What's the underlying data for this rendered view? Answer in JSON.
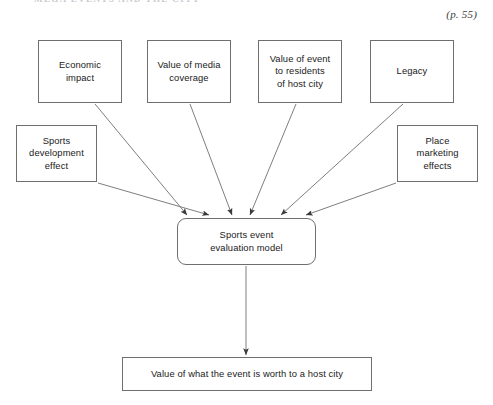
{
  "page": {
    "width": 493,
    "height": 405,
    "background": "#ffffff",
    "page_reference": "(p. 55)",
    "cropped_header_text": "MEGA EVENTS AND THE CITY"
  },
  "diagram": {
    "title": "Sports event evaluation model",
    "type": "convergent-flow-diagram",
    "line_color": "#6f6f6f",
    "text_color": "#1a1a1a",
    "nodes": [
      {
        "id": "economic-impact",
        "label": "Economic\nimpact",
        "role": "input",
        "x": 38,
        "y": 40,
        "w": 84,
        "h": 63,
        "shape": "rectangle"
      },
      {
        "id": "value-of-media-coverage",
        "label": "Value of media\ncoverage",
        "role": "input",
        "x": 147,
        "y": 40,
        "w": 84,
        "h": 63,
        "shape": "rectangle"
      },
      {
        "id": "value-of-event-to-residents",
        "label": "Value of event\nto residents\nof host city",
        "role": "input",
        "x": 258,
        "y": 40,
        "w": 84,
        "h": 63,
        "shape": "rectangle"
      },
      {
        "id": "legacy",
        "label": "Legacy",
        "role": "input",
        "x": 370,
        "y": 40,
        "w": 84,
        "h": 63,
        "shape": "rectangle"
      },
      {
        "id": "sports-development-effect",
        "label": "Sports\ndevelopment\neffect",
        "role": "input",
        "x": 16,
        "y": 125,
        "w": 81,
        "h": 57,
        "shape": "rectangle"
      },
      {
        "id": "place-marketing-effects",
        "label": "Place\nmarketing\neffects",
        "role": "input",
        "x": 397,
        "y": 125,
        "w": 81,
        "h": 57,
        "shape": "rectangle"
      },
      {
        "id": "sports-event-evaluation-model",
        "label": "Sports event\nevaluation model",
        "role": "process",
        "x": 177,
        "y": 218,
        "w": 139,
        "h": 47,
        "shape": "rounded-rectangle"
      },
      {
        "id": "value-to-host-city",
        "label": "Value of what the event is worth to a host city",
        "role": "output",
        "x": 122,
        "y": 357,
        "w": 250,
        "h": 34,
        "shape": "rectangle"
      }
    ],
    "edges": [
      {
        "id": "edge-economic-impact",
        "from": "economic-impact",
        "to": "sports-event-evaluation-model",
        "x1": 95,
        "y1": 104,
        "x2": 187,
        "y2": 215
      },
      {
        "id": "edge-sports-development",
        "from": "sports-development-effect",
        "to": "sports-event-evaluation-model",
        "x1": 98,
        "y1": 183,
        "x2": 209,
        "y2": 215
      },
      {
        "id": "edge-media-coverage",
        "from": "value-of-media-coverage",
        "to": "sports-event-evaluation-model",
        "x1": 190,
        "y1": 104,
        "x2": 232,
        "y2": 215
      },
      {
        "id": "edge-residents",
        "from": "value-of-event-to-residents",
        "to": "sports-event-evaluation-model",
        "x1": 296,
        "y1": 104,
        "x2": 250,
        "y2": 215
      },
      {
        "id": "edge-legacy",
        "from": "legacy",
        "to": "sports-event-evaluation-model",
        "x1": 403,
        "y1": 104,
        "x2": 281,
        "y2": 215
      },
      {
        "id": "edge-place-marketing",
        "from": "place-marketing-effects",
        "to": "sports-event-evaluation-model",
        "x1": 396,
        "y1": 183,
        "x2": 306,
        "y2": 215
      },
      {
        "id": "edge-model-to-output",
        "from": "sports-event-evaluation-model",
        "to": "value-to-host-city",
        "x1": 246,
        "y1": 266,
        "x2": 246,
        "y2": 355
      }
    ]
  }
}
